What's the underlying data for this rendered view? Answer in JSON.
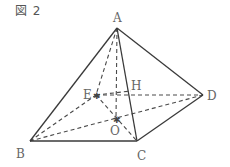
{
  "figure": {
    "title": "図 2",
    "shape": "square pyramid",
    "vertices": {
      "A": {
        "label": "A",
        "x": 117,
        "y": 28
      },
      "B": {
        "label": "B",
        "x": 30,
        "y": 141
      },
      "C": {
        "label": "C",
        "x": 137,
        "y": 141
      },
      "D": {
        "label": "D",
        "x": 203,
        "y": 95
      },
      "E": {
        "label": "E",
        "x": 96,
        "y": 95
      }
    },
    "points": {
      "O": {
        "label": "O",
        "x": 116,
        "y": 119
      },
      "H": {
        "label": "H",
        "x": 131,
        "y": 91
      }
    },
    "solid_edges": [
      "AB",
      "AC",
      "AD",
      "BC",
      "CD"
    ],
    "hidden_edges": [
      "AE",
      "AO",
      "BE",
      "ED",
      "BD",
      "EC",
      "EH",
      "OH"
    ]
  }
}
